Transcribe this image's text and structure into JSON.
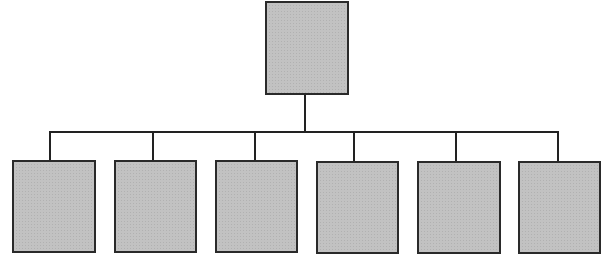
{
  "diagram": {
    "type": "org-chart",
    "colors": {
      "node_fill": "#bdbdbd",
      "node_border": "#2a2a2a",
      "connector": "#222222",
      "background": "#ffffff"
    },
    "root": {
      "label": "",
      "box": {
        "x": 265,
        "y": 1,
        "w": 84,
        "h": 94
      }
    },
    "bus": {
      "y": 131,
      "x1": 50,
      "x2": 559
    },
    "children": [
      {
        "label": "",
        "box": {
          "x": 12,
          "y": 160,
          "w": 84,
          "h": 93
        },
        "drop_x": 50
      },
      {
        "label": "",
        "box": {
          "x": 114,
          "y": 160,
          "w": 83,
          "h": 93
        },
        "drop_x": 153
      },
      {
        "label": "",
        "box": {
          "x": 215,
          "y": 160,
          "w": 83,
          "h": 93
        },
        "drop_x": 255
      },
      {
        "label": "",
        "box": {
          "x": 316,
          "y": 161,
          "w": 83,
          "h": 93
        },
        "drop_x": 354
      },
      {
        "label": "",
        "box": {
          "x": 417,
          "y": 161,
          "w": 84,
          "h": 93
        },
        "drop_x": 456
      },
      {
        "label": "",
        "box": {
          "x": 518,
          "y": 161,
          "w": 83,
          "h": 93
        },
        "drop_x": 558
      }
    ]
  }
}
